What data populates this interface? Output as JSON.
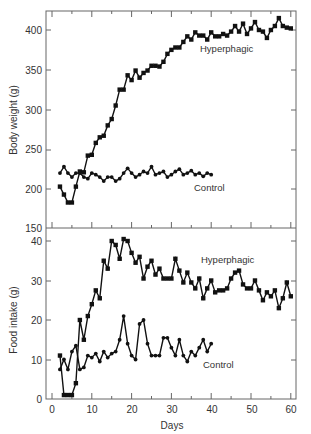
{
  "chart_data": [
    {
      "type": "line",
      "title": "",
      "xlabel": "",
      "ylabel": "Body weight (g)",
      "xlim": [
        -1,
        62
      ],
      "ylim": [
        150,
        425
      ],
      "yticks": [
        150,
        200,
        250,
        300,
        350,
        400
      ],
      "grid": false,
      "legend": "inline labels",
      "series": [
        {
          "name": "Hyperphagic",
          "marker": "square",
          "x": [
            2,
            3,
            4,
            5,
            6,
            7,
            8,
            9,
            10,
            11,
            12,
            13,
            14,
            15,
            16,
            17,
            18,
            19,
            20,
            21,
            22,
            23,
            24,
            25,
            26,
            27,
            28,
            29,
            30,
            31,
            32,
            33,
            34,
            35,
            36,
            37,
            38,
            39,
            40,
            41,
            42,
            43,
            44,
            45,
            46,
            47,
            48,
            49,
            50,
            51,
            52,
            53,
            54,
            55,
            56,
            57,
            58,
            59,
            60
          ],
          "values": [
            203,
            193,
            183,
            183,
            203,
            222,
            221,
            242,
            243,
            258,
            265,
            267,
            280,
            288,
            305,
            325,
            325,
            343,
            337,
            349,
            340,
            346,
            349,
            355,
            355,
            354,
            360,
            370,
            375,
            378,
            378,
            385,
            392,
            388,
            397,
            393,
            393,
            388,
            397,
            392,
            392,
            395,
            393,
            398,
            405,
            398,
            408,
            395,
            402,
            410,
            400,
            398,
            390,
            400,
            405,
            415,
            405,
            403,
            402
          ],
          "label_text": "Hyperphagic"
        },
        {
          "name": "Control",
          "marker": "circle",
          "x": [
            2,
            3,
            4,
            5,
            6,
            7,
            8,
            9,
            10,
            11,
            12,
            13,
            14,
            15,
            16,
            17,
            18,
            19,
            20,
            21,
            22,
            23,
            24,
            25,
            26,
            27,
            28,
            29,
            30,
            31,
            32,
            33,
            34,
            35,
            36,
            37,
            38,
            39,
            40
          ],
          "values": [
            220,
            228,
            220,
            215,
            220,
            220,
            215,
            213,
            220,
            218,
            215,
            210,
            215,
            215,
            210,
            213,
            220,
            226,
            220,
            215,
            218,
            222,
            220,
            228,
            218,
            220,
            222,
            215,
            218,
            222,
            225,
            218,
            220,
            223,
            218,
            220,
            216,
            220,
            218
          ],
          "label_text": "Control"
        }
      ]
    },
    {
      "type": "line",
      "title": "",
      "xlabel": "Days",
      "ylabel": "Food intake (g)",
      "xlim": [
        -1,
        62
      ],
      "ylim": [
        0,
        43
      ],
      "xticks": [
        0,
        10,
        20,
        30,
        40,
        50,
        60
      ],
      "yticks": [
        0,
        10,
        20,
        30,
        40
      ],
      "grid": false,
      "legend": "inline labels",
      "series": [
        {
          "name": "Hyperphagic",
          "marker": "square",
          "x": [
            2,
            3,
            4,
            5,
            6,
            7,
            8,
            9,
            10,
            11,
            12,
            13,
            14,
            15,
            16,
            17,
            18,
            19,
            20,
            21,
            22,
            23,
            24,
            25,
            26,
            27,
            28,
            29,
            30,
            31,
            32,
            33,
            34,
            35,
            36,
            37,
            38,
            39,
            40,
            41,
            42,
            43,
            44,
            45,
            46,
            47,
            48,
            49,
            50,
            51,
            52,
            53,
            54,
            55,
            56,
            57,
            58,
            59,
            60
          ],
          "values": [
            11,
            1,
            1,
            1,
            4,
            20,
            15,
            21,
            24,
            27.5,
            25.5,
            35,
            33,
            40,
            39,
            35.5,
            40.5,
            40,
            37,
            34.5,
            36,
            30.5,
            33.5,
            35,
            31.5,
            33,
            30.5,
            30.5,
            30.5,
            35.5,
            32.5,
            29.5,
            32,
            29.5,
            28,
            30.5,
            25.5,
            28,
            30,
            27,
            27.5,
            27.5,
            28,
            30.5,
            32,
            32.5,
            29,
            28,
            28,
            30,
            27.5,
            25,
            27,
            26,
            27.5,
            23,
            25.5,
            29.5,
            26,
            28
          ],
          "label_text": "Hyperphagic"
        },
        {
          "name": "Control",
          "marker": "circle",
          "x": [
            2,
            3,
            4,
            5,
            6,
            7,
            8,
            9,
            10,
            11,
            12,
            13,
            14,
            15,
            16,
            17,
            18,
            19,
            20,
            21,
            22,
            23,
            24,
            25,
            26,
            27,
            28,
            29,
            30,
            31,
            32,
            33,
            34,
            35,
            36,
            37,
            38,
            39,
            40
          ],
          "values": [
            7.5,
            10,
            7.5,
            12,
            13.5,
            7.5,
            8,
            11,
            10.5,
            11.5,
            9.5,
            12,
            10.5,
            11.5,
            12,
            15,
            21,
            14,
            11,
            10,
            19,
            20,
            14,
            11,
            11,
            11,
            15.5,
            15.5,
            13,
            11,
            15,
            11,
            9.5,
            12,
            11,
            13,
            15,
            12,
            14
          ],
          "label_text": "Control"
        }
      ]
    }
  ],
  "labels": {
    "top_ylabel": "Body weight (g)",
    "bottom_ylabel": "Food intake (g)",
    "xlabel": "Days",
    "top_hyper": "Hyperphagic",
    "top_control": "Control",
    "bottom_hyper": "Hyperphagic",
    "bottom_control": "Control"
  },
  "ticks": {
    "top_y": [
      "400",
      "350",
      "300",
      "250",
      "200",
      "150"
    ],
    "bottom_y": [
      "40",
      "30",
      "20",
      "10",
      "0"
    ],
    "x": [
      "0",
      "10",
      "20",
      "30",
      "40",
      "50",
      "60"
    ]
  }
}
